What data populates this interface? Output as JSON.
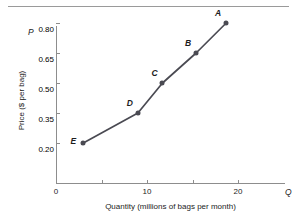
{
  "figure": {
    "top_caption": "",
    "has_top_rule": true
  },
  "chart_data": {
    "type": "line",
    "title": "",
    "xlabel": "Quantity (millions of bags per month)",
    "ylabel": "Price ($ per bag)",
    "x_axis_variable": "Q",
    "y_axis_variable": "P",
    "xlim": [
      0,
      25.2
    ],
    "ylim": [
      0,
      0.89
    ],
    "grid": false,
    "legend": "none",
    "x_ticks": [
      {
        "value": 0,
        "label": "0",
        "minor": false
      },
      {
        "value": 5,
        "label": "",
        "minor": true
      },
      {
        "value": 10,
        "label": "10",
        "minor": false
      },
      {
        "value": 15,
        "label": "",
        "minor": true
      },
      {
        "value": 20,
        "label": "20",
        "minor": false
      }
    ],
    "y_ticks": [
      {
        "value": 0.2,
        "label": "0.20"
      },
      {
        "value": 0.35,
        "label": "0.35"
      },
      {
        "value": 0.5,
        "label": "0.50"
      },
      {
        "value": 0.65,
        "label": "0.65"
      },
      {
        "value": 0.8,
        "label": "0.80"
      }
    ],
    "series": [
      {
        "name": "supply-schedule",
        "color": "#4a4a52",
        "points": [
          {
            "label": "E",
            "x": 3.0,
            "y": 0.2,
            "label_pos": "left"
          },
          {
            "label": "D",
            "x": 9.0,
            "y": 0.35,
            "label_pos": "upper-left"
          },
          {
            "label": "C",
            "x": 11.7,
            "y": 0.5,
            "label_pos": "upper-left"
          },
          {
            "label": "B",
            "x": 15.4,
            "y": 0.65,
            "label_pos": "upper-left"
          },
          {
            "label": "A",
            "x": 18.7,
            "y": 0.8,
            "label_pos": "upper-left"
          }
        ]
      }
    ]
  },
  "colors": {
    "axis": "#8d8d8d",
    "curve": "#4a4a52",
    "text": "#1c1c1c",
    "background": "#ffffff"
  }
}
